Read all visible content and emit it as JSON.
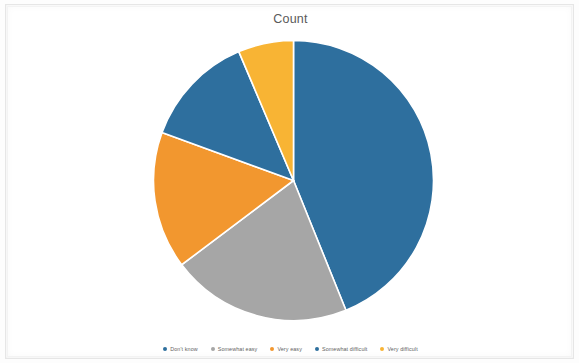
{
  "chart": {
    "title": "Count"
  },
  "legend": {
    "items": [
      {
        "label": "Don't know",
        "color": "#2e6f9e"
      },
      {
        "label": "Somewhat easy",
        "color": "#a6a6a6"
      },
      {
        "label": "Very easy",
        "color": "#f2972f"
      },
      {
        "label": "Somewhat difficult",
        "color": "#2e6f9e"
      },
      {
        "label": "Very difficult",
        "color": "#f8b434"
      }
    ]
  },
  "chart_data": {
    "type": "pie",
    "title": "Count",
    "xlabel": "",
    "ylabel": "",
    "legend_position": "bottom",
    "grid": false,
    "start_angle": 0,
    "direction": "clockwise",
    "categories": [
      "Don't know",
      "Somewhat easy",
      "Very easy",
      "Somewhat difficult",
      "Very difficult"
    ],
    "values": [
      44,
      21,
      16,
      13,
      6
    ],
    "percentages": [
      44,
      21,
      16,
      13,
      6
    ],
    "colors": [
      "#2e6f9e",
      "#a6a6a6",
      "#f2972f",
      "#2e6f9e",
      "#f8b434"
    ],
    "slice_angles_deg": [
      {
        "name": "Don't know",
        "start": 0,
        "end": 158
      },
      {
        "name": "Somewhat easy",
        "start": 158,
        "end": 233
      },
      {
        "name": "Very easy",
        "start": 233,
        "end": 290
      },
      {
        "name": "Somewhat difficult",
        "start": 290,
        "end": 337
      },
      {
        "name": "Very difficult",
        "start": 337,
        "end": 360
      }
    ]
  }
}
